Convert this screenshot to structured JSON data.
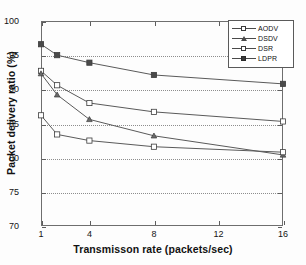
{
  "chart_data": {
    "type": "line",
    "title": "",
    "xlabel": "Transmisson rate (packets/sec)",
    "ylabel": "Packet delivery ratio (%)",
    "xlim": [
      1,
      16
    ],
    "ylim": [
      70,
      100
    ],
    "xticks": [
      1,
      4,
      8,
      12,
      16
    ],
    "yticks": [
      70,
      75,
      80,
      85,
      90,
      95,
      100
    ],
    "grid": true,
    "grid_style": "dotted-horizontal",
    "legend_position": "top-right",
    "x": [
      1,
      2,
      4,
      8,
      16
    ],
    "series": [
      {
        "name": "AODV",
        "marker": "square-open",
        "values": [
          92.7,
          90.6,
          88.0,
          86.7,
          85.3
        ]
      },
      {
        "name": "DSDV",
        "marker": "triangle",
        "values": [
          92.3,
          89.2,
          85.6,
          83.2,
          80.4
        ]
      },
      {
        "name": "DSR",
        "marker": "square-open",
        "values": [
          86.2,
          83.4,
          82.5,
          81.6,
          80.8
        ]
      },
      {
        "name": "LDPR",
        "marker": "square-filled",
        "values": [
          96.6,
          95.0,
          93.9,
          92.1,
          90.8
        ]
      }
    ],
    "colors": {
      "line": "#5a5a5a",
      "axis": "#6e6e6e",
      "grid": "#8d8d8d",
      "text": "#121212",
      "background": "#fdfdfd"
    }
  }
}
